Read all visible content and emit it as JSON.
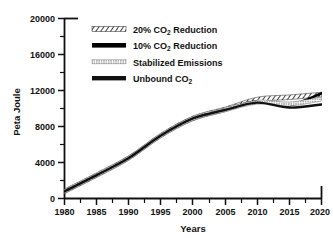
{
  "chart_data": {
    "type": "line",
    "title": "",
    "xlabel": "Years",
    "ylabel": "Peta Joule",
    "xlim": [
      1980,
      2020
    ],
    "ylim": [
      0,
      20000
    ],
    "grid": false,
    "legend_position": "upper-left-inside",
    "xticks": [
      1980,
      1985,
      1990,
      1995,
      2000,
      2005,
      2010,
      2015,
      2020
    ],
    "xtick_labels": [
      "1980",
      "1985",
      "1990",
      "1995",
      "2000",
      "2005",
      "2010",
      "2015",
      "2020"
    ],
    "yticks": [
      0,
      4000,
      8000,
      12000,
      16000,
      20000
    ],
    "ytick_labels": [
      "0",
      "4000",
      "8000",
      "12000",
      "16000",
      "20000"
    ],
    "x": [
      1980,
      1985,
      1990,
      1995,
      2000,
      2005,
      2010,
      2015,
      2020
    ],
    "series": [
      {
        "name": "20% CO2 Reduction",
        "label_main": "20% CO",
        "label_sub": "2",
        "label_tail": " Reduction",
        "style": "hatched",
        "color": "#1a1a1a",
        "values": [
          800,
          2600,
          4500,
          7000,
          8900,
          9900,
          11000,
          11250,
          11550
        ]
      },
      {
        "name": "10% CO2 Reduction",
        "label_main": "10% CO",
        "label_sub": "2",
        "label_tail": " Reduction",
        "style": "thick-solid",
        "color": "#000000",
        "values": [
          800,
          2600,
          4500,
          7000,
          8900,
          9880,
          10800,
          10350,
          11700
        ]
      },
      {
        "name": "Stabilized Emissions",
        "label_main": "Stabilized Emissions",
        "label_sub": "",
        "label_tail": "",
        "style": "stippled",
        "color": "#555555",
        "values": [
          800,
          2600,
          4500,
          7000,
          8900,
          9860,
          10700,
          10500,
          11050
        ]
      },
      {
        "name": "Unbound CO2",
        "label_main": "Unbound CO",
        "label_sub": "2",
        "label_tail": "",
        "style": "solid",
        "color": "#111111",
        "values": [
          800,
          2600,
          4500,
          7000,
          8900,
          9840,
          10650,
          10100,
          10450
        ]
      }
    ]
  }
}
